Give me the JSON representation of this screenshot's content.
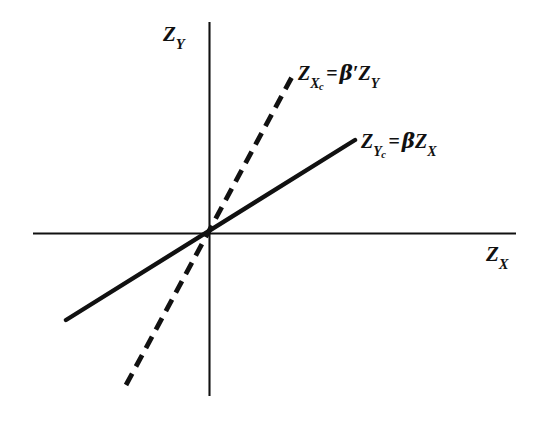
{
  "figure": {
    "background_color": "#ffffff",
    "ink_color": "#111111",
    "axes": {
      "x_axis": {
        "label": "Z",
        "label_sub": "X",
        "name": "horizontal-axis",
        "from_x": 33,
        "to_x": 516,
        "y": 233
      },
      "y_axis": {
        "label": "Z",
        "label_sub": "Y",
        "name": "vertical-axis",
        "x": 209,
        "from_y": 22,
        "to_y": 396
      },
      "origin": {
        "x": 209,
        "y": 233
      }
    },
    "lines": [
      {
        "name": "regression-line-y-on-x",
        "style": "solid",
        "label_main": "Z",
        "label_sub": "Y",
        "label_subsub": "c",
        "label_equals": "=",
        "label_rhs_beta": "β",
        "label_rhs_prime": "",
        "label_rhs_var": "Z",
        "label_rhs_sub": "X",
        "x1": 66,
        "y1": 320,
        "x2": 355,
        "y2": 140
      },
      {
        "name": "regression-line-x-on-y",
        "style": "dashed",
        "label_main": "Z",
        "label_sub": "X",
        "label_subsub": "c",
        "label_equals": "=",
        "label_rhs_beta": "β",
        "label_rhs_prime": "′",
        "label_rhs_var": "Z",
        "label_rhs_sub": "Y",
        "x1": 126,
        "y1": 385,
        "x2": 293,
        "y2": 75,
        "dash": "13 8"
      }
    ]
  },
  "chart_data": {
    "type": "line",
    "title": "",
    "subtitle": "",
    "xlabel": "Z_X",
    "ylabel": "Z_Y",
    "xlim": [
      -3.5,
      3.5
    ],
    "ylim": [
      -3.0,
      3.0
    ],
    "grid": false,
    "legend": "inline-annotations",
    "axis_style": "crossed-at-origin",
    "series": [
      {
        "name": "Z_Yc = β Z_X",
        "style": "solid",
        "equation": "Z_{Y_c} = β Z_X",
        "slope_pixels": 0.623,
        "description": "Regression of Y on X, shallower slope through origin",
        "x": [
          -1.04,
          1.05
        ],
        "y": [
          -0.65,
          0.65
        ]
      },
      {
        "name": "Z_Xc = β' Z_Y",
        "style": "dashed",
        "equation": "Z_{X_c} = β′ Z_Y",
        "slope_pixels": 1.856,
        "description": "Regression of X on Y, steeper slope through origin",
        "x": [
          -0.6,
          0.61
        ],
        "y": [
          -1.1,
          1.13
        ]
      }
    ],
    "annotations": [
      {
        "text": "Z_{X_c} = β′Z_Y",
        "attached_to": "dashed-line",
        "position": "upper-right-of-dashed-line"
      },
      {
        "text": "Z_{Y_c} = βZ_X",
        "attached_to": "solid-line",
        "position": "right-end-of-solid-line"
      },
      {
        "text": "Z_Y",
        "attached_to": "y-axis",
        "position": "top-left-of-vertical-axis"
      },
      {
        "text": "Z_X",
        "attached_to": "x-axis",
        "position": "right-below-horizontal-axis"
      }
    ]
  }
}
